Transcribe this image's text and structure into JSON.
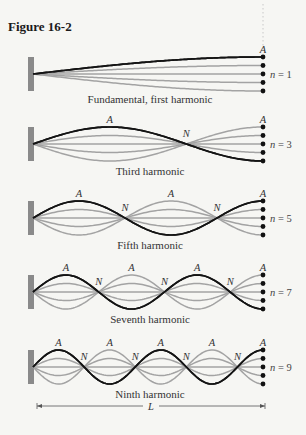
{
  "figure": {
    "title": "Figure 16-2"
  },
  "colors": {
    "background": "#f6f6f3",
    "wall": "#8a8a8a",
    "gray_curve": "#a3a3a3",
    "black_curve": "#141414",
    "dot": "#111111",
    "text": "#333333"
  },
  "geometry": {
    "wall_x": 33,
    "free_end_x": 263,
    "amplitude": 17,
    "dot_offsets": [
      -17,
      -8.5,
      0,
      8.5,
      17
    ]
  },
  "panels": [
    {
      "n": 1,
      "n_label": "n = 1",
      "center_y": 74,
      "caption": "Fundamental, first harmonic",
      "caption_y": 103,
      "black_sign": -1,
      "antinode_label": "A",
      "node_label": "N"
    },
    {
      "n": 3,
      "n_label": "n = 3",
      "center_y": 144,
      "caption": "Third harmonic",
      "caption_y": 175,
      "black_sign": -1,
      "antinode_label": "A",
      "node_label": "N"
    },
    {
      "n": 5,
      "n_label": "n = 5",
      "center_y": 218,
      "caption": "Fifth harmonic",
      "caption_y": 249,
      "black_sign": -1,
      "antinode_label": "A",
      "node_label": "N"
    },
    {
      "n": 7,
      "n_label": "n = 7",
      "center_y": 292,
      "caption": "Seventh harmonic",
      "caption_y": 323,
      "black_sign": -1,
      "antinode_label": "A",
      "node_label": "N"
    },
    {
      "n": 9,
      "n_label": "n = 9",
      "center_y": 367,
      "caption": "Ninth harmonic",
      "caption_y": 398,
      "black_sign": -1,
      "antinode_label": "A",
      "node_label": "N"
    }
  ],
  "length_marker": {
    "label": "L",
    "y": 406,
    "x_start": 37,
    "x_end": 265
  },
  "chart_data": {
    "type": "diagram",
    "title": "Figure 16-2",
    "harmonics": [
      {
        "n": 1,
        "caption": "Fundamental, first harmonic",
        "nodes_interior": 0,
        "antinodes": 1
      },
      {
        "n": 3,
        "caption": "Third harmonic",
        "nodes_interior": 1,
        "antinodes": 2
      },
      {
        "n": 5,
        "caption": "Fifth harmonic",
        "nodes_interior": 2,
        "antinodes": 3
      },
      {
        "n": 7,
        "caption": "Seventh harmonic",
        "nodes_interior": 3,
        "antinodes": 4
      },
      {
        "n": 9,
        "caption": "Ninth harmonic",
        "nodes_interior": 4,
        "antinodes": 5
      }
    ],
    "labels": {
      "antinode": "A",
      "node": "N",
      "length": "L"
    }
  }
}
